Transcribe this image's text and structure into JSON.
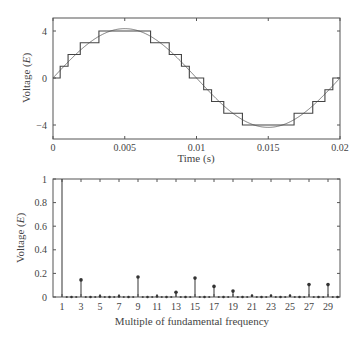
{
  "chart_data": [
    {
      "type": "line",
      "title": "",
      "xlabel": "Time (s)",
      "ylabel": "Voltage (E)",
      "xlim": [
        0,
        0.02
      ],
      "ylim": [
        -5.2,
        5.2
      ],
      "grid": false,
      "legend": null,
      "x_ticks": [
        {
          "value": 0,
          "label": "0"
        },
        {
          "value": 0.005,
          "label": "0.005"
        },
        {
          "value": 0.01,
          "label": "0.01"
        },
        {
          "value": 0.015,
          "label": "0.015"
        },
        {
          "value": 0.02,
          "label": "0.02"
        }
      ],
      "y_ticks": [
        {
          "value": 4,
          "label": "4"
        },
        {
          "value": 0,
          "label": "0"
        },
        {
          "value": -4,
          "label": "−4"
        }
      ],
      "series": [
        {
          "name": "Staircase multilevel output",
          "kind": "step",
          "switch_times": [
            0,
            0.0005,
            0.00105,
            0.0019,
            0.0032,
            0.0068,
            0.0081,
            0.00895,
            0.0095,
            0.0105,
            0.01105,
            0.0119,
            0.0132,
            0.0168,
            0.0181,
            0.01895,
            0.0195,
            0.02
          ],
          "levels": [
            0,
            1,
            2,
            3,
            4,
            3,
            2,
            1,
            0,
            -1,
            -2,
            -3,
            -4,
            -3,
            -2,
            -1,
            0
          ]
        },
        {
          "name": "Fundamental sine",
          "kind": "sine",
          "amplitude": 4.2,
          "frequency_hz": 50
        }
      ]
    },
    {
      "type": "stem",
      "title": "",
      "xlabel": "Multiple of fundamental frequency",
      "ylabel": "Voltage (E)",
      "xlim": [
        0,
        30.3
      ],
      "ylim": [
        0,
        1
      ],
      "grid": false,
      "legend": null,
      "x_ticks": [
        "1",
        "3",
        "5",
        "7",
        "9",
        "11",
        "13",
        "15",
        "17",
        "19",
        "21",
        "23",
        "25",
        "27",
        "29"
      ],
      "y_ticks": [
        {
          "value": 0,
          "label": "0"
        },
        {
          "value": 0.2,
          "label": "0.2"
        },
        {
          "value": 0.4,
          "label": "0.4"
        },
        {
          "value": 0.6,
          "label": "0.6"
        },
        {
          "value": 0.8,
          "label": "0.8"
        },
        {
          "value": 1,
          "label": "1"
        }
      ],
      "categories": [
        1,
        2,
        3,
        4,
        5,
        6,
        7,
        8,
        9,
        10,
        11,
        12,
        13,
        14,
        15,
        16,
        17,
        18,
        19,
        20,
        21,
        22,
        23,
        24,
        25,
        26,
        27,
        28,
        29,
        30
      ],
      "values": [
        1.0,
        0,
        0.145,
        0,
        0.005,
        0,
        0.005,
        0,
        0.17,
        0,
        0.005,
        0,
        0.04,
        0,
        0.16,
        0,
        0.09,
        0,
        0.05,
        0,
        0.01,
        0,
        0.01,
        0,
        0.01,
        0,
        0.105,
        0,
        0.105,
        0
      ]
    }
  ]
}
